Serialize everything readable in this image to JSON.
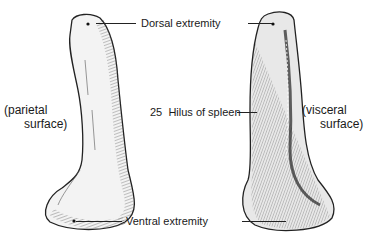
{
  "labels": {
    "dorsal": "Dorsal extremity",
    "hilus_num": "25",
    "hilus": "Hilus of spleen",
    "ventral": "Ventral extremity"
  },
  "surfaces": {
    "left_line1": "(parietal",
    "left_line2": "surface)",
    "right_line1": "(visceral",
    "right_line2": "surface)"
  }
}
